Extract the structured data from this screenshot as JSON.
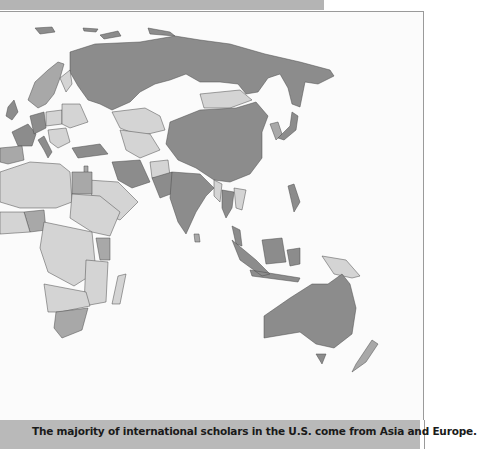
{
  "document": {
    "caption": "The majority of international scholars in the U.S. come from Asia and Europe."
  },
  "map": {
    "type": "choropleth",
    "region_shown": "Eastern Hemisphere (Europe, Africa, Asia, Oceania)",
    "shading_levels": {
      "high": "#8c8c8c",
      "medium": "#a8a8a8",
      "low": "#d4d4d4"
    },
    "highlighted_high": [
      "Russia",
      "China",
      "India",
      "Japan",
      "Australia",
      "Germany",
      "France",
      "United Kingdom",
      "Italy",
      "Turkey",
      "Iran",
      "Pakistan",
      "South Korea",
      "Indonesia",
      "Thailand",
      "Philippines",
      "Malaysia"
    ],
    "highlighted_medium": [
      "Egypt",
      "Nigeria",
      "Kenya",
      "South Africa",
      "Spain",
      "Sweden",
      "Norway",
      "Israel",
      "New Zealand",
      "Vietnam",
      "Bangladesh"
    ],
    "other_countries": "light gray"
  }
}
